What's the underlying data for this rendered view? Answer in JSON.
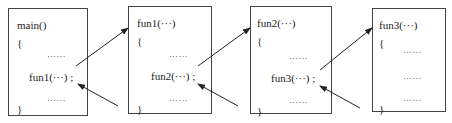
{
  "diagram": {
    "type": "function-call-chain",
    "boxes": [
      {
        "id": "main",
        "header": "main()",
        "open": "{",
        "dots_top": "……",
        "call": "fun1(···) ;",
        "dots_bottom": "……",
        "close": "}"
      },
      {
        "id": "fun1",
        "header": "fun1(···)",
        "open": "{",
        "dots_top": "……",
        "call": "fun2(···) ;",
        "dots_bottom": "……",
        "close": "}"
      },
      {
        "id": "fun2",
        "header": "fun2(···)",
        "open": "{",
        "dots_top": "……",
        "call": "fun3(···) ;",
        "dots_bottom": "……",
        "close": "}"
      },
      {
        "id": "fun3",
        "header": "fun3(···)",
        "open": "{",
        "dots_1": "……",
        "dots_2": "……",
        "dots_3": "……",
        "close": "}"
      }
    ],
    "arrows": [
      {
        "from": "main.call",
        "to": "fun1.header",
        "kind": "call"
      },
      {
        "from": "fun1.end",
        "to": "main.call",
        "kind": "return"
      },
      {
        "from": "fun1.call",
        "to": "fun2.header",
        "kind": "call"
      },
      {
        "from": "fun2.end",
        "to": "fun1.call",
        "kind": "return"
      },
      {
        "from": "fun2.call",
        "to": "fun3.header",
        "kind": "call"
      },
      {
        "from": "fun3.end",
        "to": "fun2.call",
        "kind": "return"
      }
    ]
  }
}
